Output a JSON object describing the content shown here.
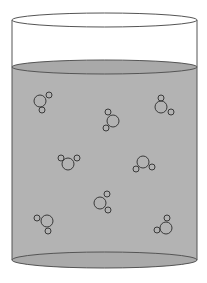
{
  "diagram": {
    "title": "Water molecules in a container",
    "colors": {
      "background": "#ffffff",
      "liquid": "#b3b3b3",
      "liquid_surface": "#a9a9a9",
      "bottom_shade": "#aaaaaa",
      "outline": "#555555",
      "molecule_stroke": "#3a3a3a"
    },
    "container": {
      "cx": 104.5,
      "rx": 92.5,
      "top_cy": 20,
      "top_ry": 7,
      "liquid_cy": 67,
      "liquid_ry": 7,
      "bottom_cy": 260,
      "bottom_ry": 8
    },
    "molecules": [
      {
        "name": "water-molecule-1",
        "o": [
          40,
          101
        ],
        "h1": [
          49,
          95
        ],
        "h2": [
          42,
          110
        ]
      },
      {
        "name": "water-molecule-2",
        "o": [
          161,
          107
        ],
        "h1": [
          161,
          98
        ],
        "h2": [
          171,
          112
        ]
      },
      {
        "name": "water-molecule-3",
        "o": [
          113,
          121
        ],
        "h1": [
          108,
          112
        ],
        "h2": [
          106,
          128
        ]
      },
      {
        "name": "water-molecule-4",
        "o": [
          68,
          164
        ],
        "h1": [
          61,
          158
        ],
        "h2": [
          77,
          158
        ]
      },
      {
        "name": "water-molecule-5",
        "o": [
          143,
          162
        ],
        "h1": [
          136,
          169
        ],
        "h2": [
          152,
          167
        ]
      },
      {
        "name": "water-molecule-6",
        "o": [
          100,
          203
        ],
        "h1": [
          107,
          194
        ],
        "h2": [
          108,
          210
        ]
      },
      {
        "name": "water-molecule-7",
        "o": [
          47,
          221
        ],
        "h1": [
          37,
          218
        ],
        "h2": [
          48,
          231
        ]
      },
      {
        "name": "water-molecule-8",
        "o": [
          166,
          228
        ],
        "h1": [
          167,
          218
        ],
        "h2": [
          157,
          230
        ]
      }
    ],
    "atom_radii": {
      "oxygen": 6,
      "hydrogen": 3
    }
  }
}
